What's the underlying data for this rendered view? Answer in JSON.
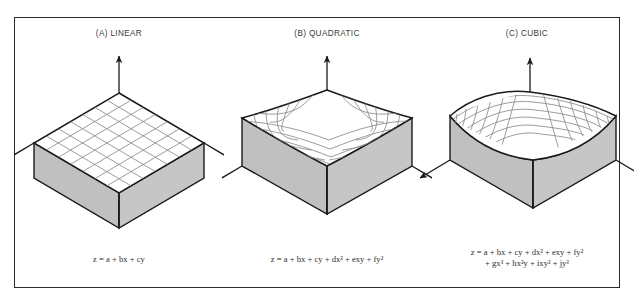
{
  "figure": {
    "background_color": "#ffffff",
    "frame_color": "#2b2b2b",
    "surface_fill": "#ffffff",
    "block_side_fill": "#c0c0c0",
    "block_front_fill": "#c6c6c6",
    "mesh_color": "#8a8a8a",
    "outline_color": "#1a1a1a",
    "axis_color": "#1a1a1a"
  },
  "panels": [
    {
      "id": "linear",
      "title": "(A) LINEAR",
      "equation_lines": [
        "z = a + bx + cy"
      ],
      "surface_type": "planar-tilted-grid",
      "grid_divisions": 7,
      "axes": [
        "z-up",
        "x-left-down",
        "y-right-down"
      ]
    },
    {
      "id": "quadratic",
      "title": "(B) QUADRATIC",
      "equation_lines": [
        "z = a + bx + cy + dx² + exy + fy²"
      ],
      "surface_type": "saddle-bowl",
      "grid_divisions": 7,
      "axes": [
        "z-up",
        "x-left-down",
        "y-right-down"
      ]
    },
    {
      "id": "cubic",
      "title": "(C) CUBIC",
      "equation_lines": [
        "z = a + bx + cy + dx² + exy + fy²",
        "+ gx³ + hx²y + ixy² + jy³"
      ],
      "surface_type": "wave-s-curve",
      "grid_divisions": 7,
      "axes": [
        "z-up",
        "x-left-down",
        "y-right-down"
      ]
    }
  ]
}
